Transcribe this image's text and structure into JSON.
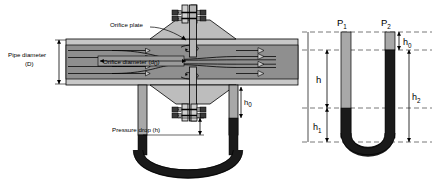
{
  "figure": {
    "type": "engineering-diagram"
  },
  "labels": {
    "pipe_diameter_line1": "Pipe diameter",
    "pipe_diameter_line2": "(D)",
    "orifice_plate": "Orifice plate",
    "orifice_diameter": "Orifice diameter (d",
    "orifice_diameter_sub": "0",
    "orifice_diameter_close": ")",
    "pressure_drop": "Pressure drop (h)",
    "h_zero_main": "h",
    "h_zero_main_sub": "0"
  },
  "manometer": {
    "p1": "P",
    "p1_sub": "1",
    "p2": "P",
    "p2_sub": "2",
    "h0": "h",
    "h0_sub": "0",
    "h": "h",
    "h1": "h",
    "h1_sub": "1",
    "h2": "h",
    "h2_sub": "2"
  },
  "colors": {
    "pipe_wall": "#c8c8c8",
    "pipe_interior": "#8f8f8f",
    "plate_metal": "#b5b5b5",
    "fluid_light": "#a8a8a8",
    "fluid_dark": "#1a1a1a",
    "outline": "#000000",
    "dashed": "#555555",
    "background": "#ffffff"
  },
  "icons": {
    "flow_arrow": "flow-arrow-icon",
    "eddy": "eddy-swirl-icon",
    "bolt": "bolt-icon",
    "dimension_arrow": "dimension-arrow-icon"
  }
}
